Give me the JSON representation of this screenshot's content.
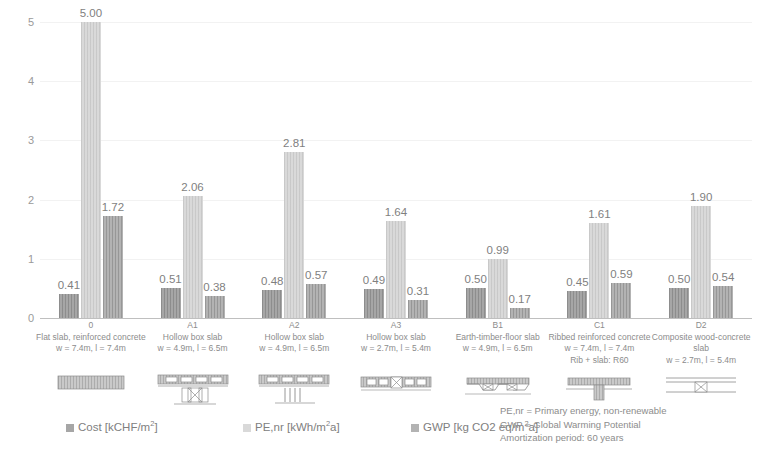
{
  "chart_data": {
    "type": "bar",
    "title": "",
    "xlabel": "",
    "ylabel": "",
    "ylim": [
      0,
      5
    ],
    "yticks": [
      "0",
      "1",
      "2",
      "3",
      "4",
      "5"
    ],
    "grid": true,
    "legend_position": "bottom",
    "categories": [
      "0",
      "A1",
      "A2",
      "A3",
      "B1",
      "C1",
      "D2"
    ],
    "category_details": [
      {
        "code": "0",
        "name": "Flat slab, reinforced concrete",
        "dims": "w = 7.4m, l = 7.4m",
        "extra": ""
      },
      {
        "code": "A1",
        "name": "Hollow box slab",
        "dims": "w = 4.9m, l = 6.5m",
        "extra": ""
      },
      {
        "code": "A2",
        "name": "Hollow box slab",
        "dims": "w = 4.9m, l = 6.5m",
        "extra": ""
      },
      {
        "code": "A3",
        "name": "Hollow box slab",
        "dims": "w = 2.7m, l = 5.4m",
        "extra": ""
      },
      {
        "code": "B1",
        "name": "Earth-timber-floor slab",
        "dims": "w = 4.9m, l = 6.5m",
        "extra": ""
      },
      {
        "code": "C1",
        "name": "Ribbed reinforced concrete",
        "dims": "w = 7.4m, l = 7.4m",
        "extra": "Rib + slab: R60"
      },
      {
        "code": "D2",
        "name": "Composite wood-concrete",
        "name2": "slab",
        "dims": "w = 2.7m, l = 5.4m",
        "extra": ""
      }
    ],
    "series": [
      {
        "name": "Cost [kCHF/m2a]",
        "key": "cost",
        "color": "#a6a6a6",
        "values": [
          0.41,
          0.51,
          0.48,
          0.49,
          0.5,
          0.45,
          0.5
        ],
        "labels": [
          "0.41",
          "0.51",
          "0.48",
          "0.49",
          "0.50",
          "0.45",
          "0.50"
        ]
      },
      {
        "name": "PE,nr [kWh/m2a]",
        "key": "pe",
        "color": "#d9d9d9",
        "values": [
          5.0,
          2.06,
          2.81,
          1.64,
          0.99,
          1.61,
          1.9
        ],
        "labels": [
          "5.00",
          "2.06",
          "2.81",
          "1.64",
          "0.99",
          "1.61",
          "1.90"
        ]
      },
      {
        "name": "GWP [kg CO2 eq/m2a]",
        "key": "gwp",
        "color": "#b3b3b3",
        "values": [
          1.72,
          0.38,
          0.57,
          0.31,
          0.17,
          0.59,
          0.54
        ],
        "labels": [
          "1.72",
          "0.38",
          "0.57",
          "0.31",
          "0.17",
          "0.59",
          "0.54"
        ]
      }
    ]
  },
  "legend": {
    "items": [
      {
        "pre": "Cost [kCHF/m",
        "sup": "2",
        "post": "]"
      },
      {
        "pre": "PE,nr [kWh/m",
        "sup": "2",
        "post": "a]"
      },
      {
        "pre": "GWP [kg CO2 eq/m",
        "sup": "2",
        "post": "a]"
      }
    ]
  },
  "notes": [
    "PE,nr = Primary energy, non-renewable",
    "GWP =  Global Warming Potential",
    "Amortization period: 60 years"
  ],
  "pictograms": [
    {
      "name": "flat-slab-reinforced-concrete-diagram"
    },
    {
      "name": "hollow-box-slab-column-support-diagram"
    },
    {
      "name": "hollow-box-slab-posts-support-diagram"
    },
    {
      "name": "hollow-box-slab-narrow-diagram"
    },
    {
      "name": "earth-timber-floor-slab-diagram"
    },
    {
      "name": "ribbed-reinforced-concrete-t-beam-diagram"
    },
    {
      "name": "composite-wood-concrete-slab-diagram"
    }
  ]
}
